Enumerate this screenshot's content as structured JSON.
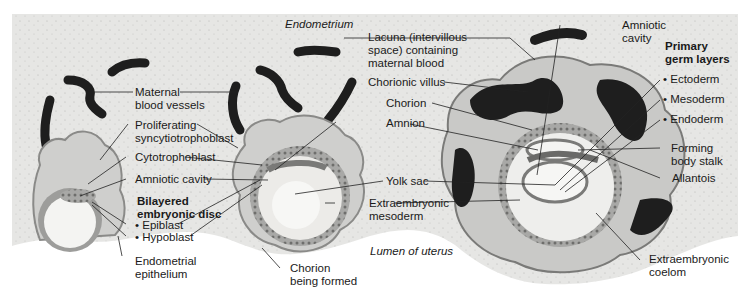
{
  "diagram": {
    "regions": {
      "endometrium": "Endometrium",
      "lumen": "Lumen of uterus"
    },
    "labels": {
      "maternal_blood_vessels": [
        "Maternal",
        "blood vessels"
      ],
      "proliferating_syncytiotrophoblast": [
        "Proliferating",
        "syncytiotrophoblast"
      ],
      "cytotrophoblast": "Cytotrophoblast",
      "amniotic_cavity_left": "Amniotic cavity",
      "bilayered_embryonic_disc": [
        "Bilayered",
        "embryonic disc"
      ],
      "epiblast": "• Epiblast",
      "hypoblast": "• Hypoblast",
      "endometrial_epithelium": [
        "Endometrial",
        "epithelium"
      ],
      "lacuna": [
        "Lacuna (intervillous",
        "space) containing",
        "maternal blood"
      ],
      "chorionic_villus": "Chorionic villus",
      "chorion": "Chorion",
      "amnion": "Amnion",
      "yolk_sac": "Yolk sac",
      "extraembryonic_mesoderm": [
        "Extraembryonic",
        "mesoderm"
      ],
      "chorion_being_formed": [
        "Chorion",
        "being formed"
      ],
      "amniotic_cavity_right": [
        "Amniotic",
        "cavity"
      ],
      "primary_germ_layers": [
        "Primary",
        "germ layers"
      ],
      "ectoderm": "• Ectoderm",
      "mesoderm": "• Mesoderm",
      "endoderm": "• Endoderm",
      "forming_body_stalk": [
        "Forming",
        "body stalk"
      ],
      "allantois": "Allantois",
      "extraembryonic_coelom": [
        "Extraembryonic",
        "coelom"
      ]
    },
    "colors": {
      "endometrium_bg": "#e6e6e4",
      "blood": "#1e1e1e",
      "tissue_light": "#c9c9c7",
      "tissue_mid": "#9d9d9b",
      "cavity": "#f4f4f2",
      "leader_line": "#222222"
    }
  }
}
